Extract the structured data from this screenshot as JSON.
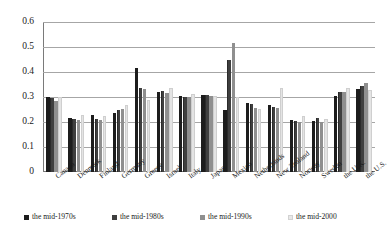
{
  "chart_data": {
    "type": "bar",
    "title": "",
    "xlabel": "",
    "ylabel": "",
    "ylim": [
      0,
      0.6
    ],
    "yticks": [
      "0",
      "0.1",
      "0.2",
      "0.3",
      "0.4",
      "0.5",
      "0.6"
    ],
    "ytick_values": [
      0,
      0.1,
      0.2,
      0.3,
      0.4,
      0.5,
      0.6
    ],
    "grid": true,
    "legend_position": "bottom",
    "categories": [
      "Canada",
      "Denmark",
      "Finland",
      "Germany",
      "Greece",
      "Israel",
      "Italy",
      "Japan",
      "Mexico",
      "Netherlands",
      "New Zealand",
      "Norway",
      "Sweden",
      "the U.K.",
      "the U.S."
    ],
    "series": [
      {
        "name": "the mid-1970s",
        "color": "#1c1c1c",
        "values": [
          0.3,
          0.216,
          0.23,
          0.236,
          0.415,
          0.32,
          0.305,
          0.31,
          0.25,
          0.277,
          0.27,
          0.21,
          0.205,
          0.305,
          0.334
        ]
      },
      {
        "name": "the mid-1980s",
        "color": "#3f3f3f",
        "values": [
          0.295,
          0.213,
          0.211,
          0.247,
          0.336,
          0.325,
          0.3,
          0.31,
          0.447,
          0.272,
          0.262,
          0.206,
          0.218,
          0.32,
          0.345
        ]
      },
      {
        "name": "the mid-1990s",
        "color": "#8f8f8f",
        "values": [
          0.284,
          0.208,
          0.207,
          0.253,
          0.333,
          0.318,
          0.302,
          0.305,
          0.516,
          0.258,
          0.257,
          0.201,
          0.199,
          0.32,
          0.356
        ]
      },
      {
        "name": "the mid-2000",
        "color": "#e4e4e4",
        "values": [
          0.3,
          0.228,
          0.226,
          0.27,
          0.287,
          0.337,
          0.311,
          0.305,
          0.3,
          0.252,
          0.335,
          0.226,
          0.212,
          0.336,
          0.33
        ]
      }
    ]
  },
  "legend": {
    "items": [
      {
        "label": "the mid-1970s"
      },
      {
        "label": "the mid-1980s"
      },
      {
        "label": "the mid-1990s"
      },
      {
        "label": "the mid-2000"
      }
    ]
  }
}
